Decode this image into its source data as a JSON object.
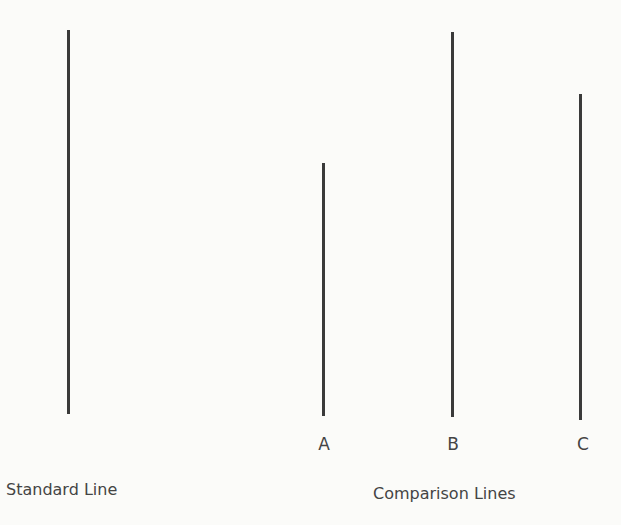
{
  "figure": {
    "lines": [
      {
        "id": "standard",
        "x": 68,
        "top": 30,
        "bottom": 414,
        "label": ""
      },
      {
        "id": "A",
        "x": 323,
        "top": 163,
        "bottom": 416,
        "label": "A"
      },
      {
        "id": "B",
        "x": 452,
        "top": 32,
        "bottom": 417,
        "label": "B"
      },
      {
        "id": "C",
        "x": 580,
        "top": 94,
        "bottom": 420,
        "label": "C"
      }
    ],
    "captions": {
      "standard": "Standard Line",
      "comparison": "Comparison Lines"
    },
    "line_color": "#3a3a3a"
  }
}
